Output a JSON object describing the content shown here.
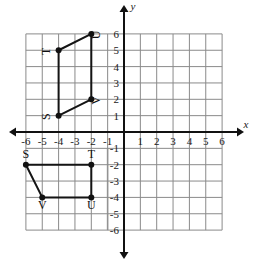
{
  "figure": {
    "kind": "coordinate-plane",
    "axis_labels": {
      "x": "x",
      "y": "y"
    },
    "x_ticks": [
      "-6",
      "-5",
      "-4",
      "-3",
      "-2",
      "-1",
      "1",
      "2",
      "3",
      "4",
      "5",
      "6"
    ],
    "y_ticks": [
      "6",
      "5",
      "4",
      "3",
      "2",
      "1",
      "-1",
      "-2",
      "-3",
      "-4",
      "-5",
      "-6"
    ],
    "x_range": [
      -6,
      6
    ],
    "y_range": [
      -6,
      6
    ],
    "grid": true,
    "colors": {
      "grid": "#8a8a8a",
      "axis": "#111111",
      "shape": "#141414",
      "vertex": "#111111",
      "faint_grid": "#c9c9c9",
      "background": "#ffffff"
    }
  },
  "shapes": [
    {
      "name": "upper-parallelogram",
      "label_rotation": -90,
      "vertices": [
        {
          "label": "S",
          "x": -4,
          "y": 1,
          "label_dx": -9,
          "label_dy": 1
        },
        {
          "label": "T",
          "x": -4,
          "y": 5,
          "label_dx": -9,
          "label_dy": 1
        },
        {
          "label": "U",
          "x": -2,
          "y": 6,
          "label_dx": 9,
          "label_dy": 1
        },
        {
          "label": "V",
          "x": -2,
          "y": 2,
          "label_dx": 9,
          "label_dy": 1
        }
      ]
    },
    {
      "name": "lower-parallelogram",
      "label_rotation": 0,
      "vertices": [
        {
          "label": "S",
          "x": -6,
          "y": -2,
          "label_dx": 0,
          "label_dy": -7
        },
        {
          "label": "T",
          "x": -2,
          "y": -2,
          "label_dx": 0,
          "label_dy": -7
        },
        {
          "label": "U",
          "x": -2,
          "y": -4,
          "label_dx": 0,
          "label_dy": 12
        },
        {
          "label": "V",
          "x": -5,
          "y": -4,
          "label_dx": 0,
          "label_dy": 12
        }
      ]
    }
  ],
  "chart_data": {
    "type": "scatter",
    "title": "",
    "xlabel": "x",
    "ylabel": "y",
    "xlim": [
      -6,
      6
    ],
    "ylim": [
      -6,
      6
    ],
    "grid": true,
    "series": [
      {
        "name": "upper-parallelogram STUV",
        "closed": true,
        "points": [
          [
            -4,
            1
          ],
          [
            -4,
            5
          ],
          [
            -2,
            6
          ],
          [
            -2,
            2
          ]
        ],
        "point_labels": [
          "S",
          "T",
          "U",
          "V"
        ]
      },
      {
        "name": "lower-parallelogram STUV",
        "closed": true,
        "points": [
          [
            -6,
            -2
          ],
          [
            -2,
            -2
          ],
          [
            -2,
            -4
          ],
          [
            -5,
            -4
          ]
        ],
        "point_labels": [
          "S",
          "T",
          "U",
          "V"
        ]
      }
    ]
  }
}
